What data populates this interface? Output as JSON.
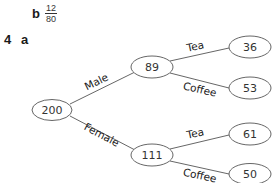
{
  "labels": {
    "part_b": "b",
    "fraction_numerator": "12",
    "fraction_denominator": "80",
    "question_number": "4",
    "part_a": "a"
  },
  "tree": {
    "root": {
      "value": "200"
    },
    "level1": [
      {
        "branch_label": "Male",
        "value": "89"
      },
      {
        "branch_label": "Female",
        "value": "111"
      }
    ],
    "level2": [
      {
        "parent": "Male",
        "branch_label": "Tea",
        "value": "36"
      },
      {
        "parent": "Male",
        "branch_label": "Coffee",
        "value": "53"
      },
      {
        "parent": "Female",
        "branch_label": "Tea",
        "value": "61"
      },
      {
        "parent": "Female",
        "branch_label": "Coffee",
        "value": "50"
      }
    ]
  },
  "colors": {
    "line": "#555555",
    "text": "#333333"
  }
}
